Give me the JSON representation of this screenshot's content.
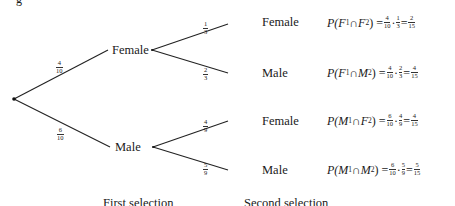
{
  "top_glyph": "g",
  "tree": {
    "first_level": [
      {
        "label": "Female",
        "prob_num": "4",
        "prob_den": "10"
      },
      {
        "label": "Male",
        "prob_num": "6",
        "prob_den": "10"
      }
    ],
    "second_level": [
      {
        "parent": "Female",
        "label": "Female",
        "prob_num": "1",
        "prob_den": "3",
        "formula": {
          "event1": "F",
          "event2": "F",
          "p1_num": "4",
          "p1_den": "10",
          "p2_num": "1",
          "p2_den": "3",
          "res_num": "2",
          "res_den": "15"
        }
      },
      {
        "parent": "Female",
        "label": "Male",
        "prob_num": "2",
        "prob_den": "3",
        "formula": {
          "event1": "F",
          "event2": "M",
          "p1_num": "4",
          "p1_den": "10",
          "p2_num": "2",
          "p2_den": "3",
          "res_num": "4",
          "res_den": "15"
        }
      },
      {
        "parent": "Male",
        "label": "Female",
        "prob_num": "4",
        "prob_den": "9",
        "formula": {
          "event1": "M",
          "event2": "F",
          "p1_num": "6",
          "p1_den": "10",
          "p2_num": "4",
          "p2_den": "9",
          "res_num": "4",
          "res_den": "15"
        }
      },
      {
        "parent": "Male",
        "label": "Male",
        "prob_num": "5",
        "prob_den": "9",
        "formula": {
          "event1": "M",
          "event2": "M",
          "p1_num": "6",
          "p1_den": "10",
          "p2_num": "5",
          "p2_den": "9",
          "res_num": "5",
          "res_den": "15"
        }
      }
    ]
  },
  "formula_parts": {
    "prob": "P(",
    "sub1": "1",
    "cap": " ∩ ",
    "sub2": "2",
    "close": ") = ",
    "dot": "·",
    "eq": " = "
  },
  "captions": {
    "first": "First selection",
    "second": "Second selection"
  },
  "colors": {
    "line": "#222222",
    "text": "#1a1a1a",
    "background": "#ffffff"
  }
}
